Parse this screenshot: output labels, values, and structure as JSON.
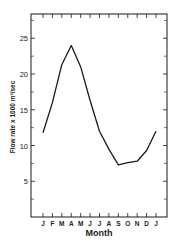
{
  "chart_data": {
    "type": "line",
    "title": "",
    "xlabel": "Month",
    "ylabel": "Flow rate x 1000 m³/sec",
    "categories": [
      "J",
      "F",
      "M",
      "A",
      "M",
      "J",
      "J",
      "A",
      "S",
      "O",
      "N",
      "D",
      "J"
    ],
    "series": [
      {
        "name": "Flow rate",
        "values": [
          11.8,
          16.0,
          21.3,
          24.0,
          21.0,
          16.3,
          12.0,
          9.5,
          7.3,
          7.6,
          7.8,
          9.3,
          12.0
        ]
      }
    ],
    "ylim": [
      0,
      28.4
    ],
    "yticks": [
      5,
      10,
      15,
      20,
      25
    ],
    "yminor_ticks": [
      2.5,
      7.5,
      12.5,
      17.5,
      22.5,
      27.5
    ],
    "grid": false,
    "legend": "none"
  },
  "colors": {
    "line": "#1a1a1a",
    "axis": "#1a1a1a",
    "background": "#ffffff"
  }
}
